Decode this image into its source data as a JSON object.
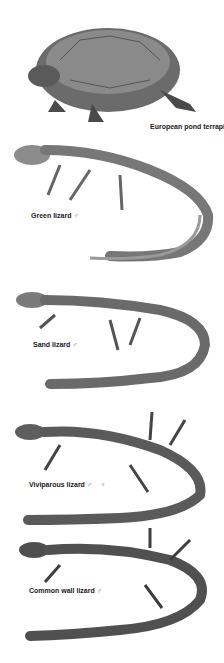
{
  "plate": {
    "subjects": [
      {
        "name": "European pond terrapin",
        "sex": ""
      },
      {
        "name": "Green lizard",
        "sex": "♂"
      },
      {
        "name": "Sand lizard",
        "sex": "♂"
      },
      {
        "name": "Viviparous lizard",
        "sex": "♂",
        "sex2": "♀"
      },
      {
        "name": "Common wall lizard",
        "sex": "♂"
      }
    ]
  }
}
